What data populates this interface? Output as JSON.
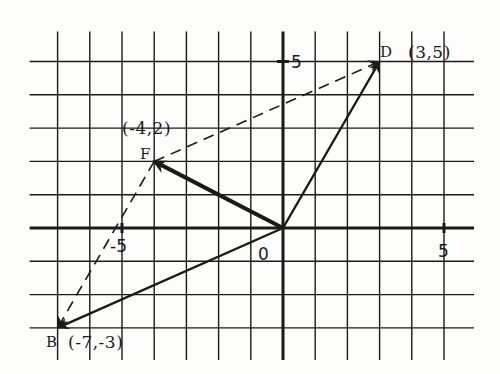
{
  "diagram": {
    "type": "coordinate-plane-vectors",
    "colors": {
      "ink": "#1a1a1a",
      "paper": "#fdfdfc"
    },
    "grid": {
      "x_range": [
        -7,
        5
      ],
      "y_range": [
        -3,
        5
      ],
      "origin_px": [
        283,
        228
      ],
      "step_px": [
        32.2,
        33.3
      ]
    },
    "axis_labels": {
      "origin": "0",
      "x_neg": "-5",
      "x_pos": "5",
      "y_pos": "5"
    },
    "points": [
      {
        "name": "D",
        "coord_label": "(3,5)",
        "x": 3,
        "y": 5
      },
      {
        "name": "F",
        "coord_label": "(-4,2)",
        "x": -4,
        "y": 2
      },
      {
        "name": "B",
        "coord_label": "(-7,-3)",
        "x": -7,
        "y": -3
      },
      {
        "name": "O",
        "x": 0,
        "y": 0
      }
    ],
    "vectors": [
      {
        "from": [
          0,
          0
        ],
        "to": [
          3,
          5
        ],
        "style": "solid",
        "label": "OD"
      },
      {
        "from": [
          0,
          0
        ],
        "to": [
          -4,
          2
        ],
        "style": "solid-bold",
        "label": "OF"
      },
      {
        "from": [
          0,
          0
        ],
        "to": [
          -7,
          -3
        ],
        "style": "solid",
        "label": "OB"
      },
      {
        "from": [
          -4,
          2
        ],
        "to": [
          3,
          5
        ],
        "style": "dashed",
        "label": "FD"
      },
      {
        "from": [
          -4,
          2
        ],
        "to": [
          -7,
          -3
        ],
        "style": "dashed",
        "label": "FB"
      }
    ]
  },
  "labels": {
    "D": "D",
    "D_coord": "(3,5)",
    "F": "F",
    "F_coord": "(-4,2)",
    "B": "B",
    "B_coord": "(-7,-3)",
    "origin": "0",
    "x_neg5": "-5",
    "x_pos5": "5",
    "y_pos5": "5"
  }
}
